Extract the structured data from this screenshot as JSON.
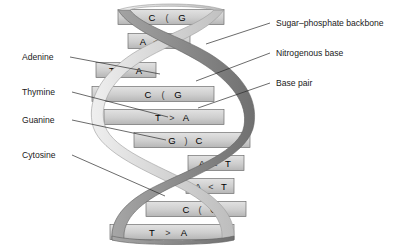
{
  "figure": {
    "background_color": "#ffffff",
    "ribbon_light_color": "#d2d2d2",
    "ribbon_dark_color": "#8c8c8c",
    "rung_fill_color": "#cfcfcf",
    "rung_stroke_color": "#6e6e6e",
    "text_color": "#1a1a1a",
    "leader_color": "#2b2b2b"
  },
  "left_labels": [
    {
      "id": "adenine",
      "text": "Adenine",
      "x": 22,
      "y": 60,
      "leader_from_x": 70,
      "leader_from_y": 57,
      "leader_to_x": 160,
      "leader_to_y": 74
    },
    {
      "id": "thymine",
      "text": "Thymine",
      "x": 22,
      "y": 95,
      "leader_from_x": 72,
      "leader_from_y": 92,
      "leader_to_x": 168,
      "leader_to_y": 117
    },
    {
      "id": "guanine",
      "text": "Guanine",
      "x": 22,
      "y": 123,
      "leader_from_x": 72,
      "leader_from_y": 120,
      "leader_to_x": 166,
      "leader_to_y": 140
    },
    {
      "id": "cytosine",
      "text": "Cytosine",
      "x": 22,
      "y": 158,
      "leader_from_x": 72,
      "leader_from_y": 155,
      "leader_to_x": 165,
      "leader_to_y": 196
    }
  ],
  "right_labels": [
    {
      "id": "sugar-phosphate-backbone",
      "text": "Sugar–phosphate backbone",
      "x": 276,
      "y": 26,
      "leader_from_x": 270,
      "leader_from_y": 23,
      "leader_to_x": 206,
      "leader_to_y": 44
    },
    {
      "id": "nitrogenous-base",
      "text": "Nitrogenous base",
      "x": 276,
      "y": 56,
      "leader_from_x": 270,
      "leader_from_y": 53,
      "leader_to_x": 196,
      "leader_to_y": 81
    },
    {
      "id": "base-pair",
      "text": "Base pair",
      "x": 276,
      "y": 86,
      "leader_from_x": 270,
      "leader_from_y": 83,
      "leader_to_x": 198,
      "leader_to_y": 108
    }
  ],
  "base_pairs": [
    {
      "index": 1,
      "left": "C",
      "bond": "(",
      "right": "G",
      "y": 17,
      "bar_x": 118,
      "bar_w": 106,
      "left_x": 152,
      "bond_x": 167,
      "right_x": 182
    },
    {
      "index": 2,
      "left": "A",
      "bond": "<",
      "right": "T",
      "y": 41,
      "bar_x": 128,
      "bar_w": 62,
      "left_x": 143,
      "bond_x": 156,
      "right_x": 170
    },
    {
      "index": 3,
      "left": "T",
      "bond": ">",
      "right": "A",
      "y": 70,
      "bar_x": 96,
      "bar_w": 60,
      "left_x": 112,
      "bond_x": 125,
      "right_x": 139
    },
    {
      "index": 4,
      "left": "C",
      "bond": "(",
      "right": "G",
      "y": 94,
      "bar_x": 92,
      "bar_w": 122,
      "left_x": 148,
      "bond_x": 163,
      "right_x": 178
    },
    {
      "index": 5,
      "left": "T",
      "bond": ">",
      "right": "A",
      "y": 117,
      "bar_x": 104,
      "bar_w": 120,
      "left_x": 158,
      "bond_x": 172,
      "right_x": 186
    },
    {
      "index": 6,
      "left": "G",
      "bond": ")",
      "right": "C",
      "y": 140,
      "bar_x": 134,
      "bar_w": 116,
      "left_x": 172,
      "bond_x": 186,
      "right_x": 199
    },
    {
      "index": 7,
      "left": "A",
      "bond": "<",
      "right": "T",
      "y": 163,
      "bar_x": 188,
      "bar_w": 56,
      "left_x": 202,
      "bond_x": 215,
      "right_x": 228
    },
    {
      "index": 8,
      "left": "A",
      "bond": "<",
      "right": "T",
      "y": 186,
      "bar_x": 186,
      "bar_w": 48,
      "left_x": 198,
      "bond_x": 211,
      "right_x": 224
    },
    {
      "index": 9,
      "left": "C",
      "bond": "(",
      "right": "G",
      "y": 209,
      "bar_x": 146,
      "bar_w": 100,
      "left_x": 186,
      "bond_x": 200,
      "right_x": 214
    },
    {
      "index": 10,
      "left": "T",
      "bond": ">",
      "right": "A",
      "y": 232,
      "bar_x": 110,
      "bar_w": 124,
      "left_x": 152,
      "bond_x": 168,
      "right_x": 184
    }
  ]
}
